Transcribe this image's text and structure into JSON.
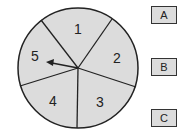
{
  "spinner": {
    "sections": [
      {
        "label": "1"
      },
      {
        "label": "2"
      },
      {
        "label": "3"
      },
      {
        "label": "4"
      },
      {
        "label": "5"
      }
    ],
    "arrow_points_to": "5",
    "fill_color": "#dcdcdc",
    "stroke_color": "#222222"
  },
  "options": [
    {
      "label": "A"
    },
    {
      "label": "B"
    },
    {
      "label": "C"
    }
  ]
}
